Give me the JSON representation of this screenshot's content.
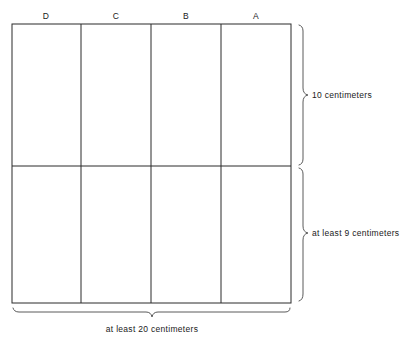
{
  "diagram": {
    "type": "engineering-dimension-diagram",
    "background_color": "#ffffff",
    "line_color": "#2b2b2b",
    "text_color": "#1a1a1a",
    "grid": {
      "left": 12,
      "right": 291,
      "top": 24,
      "bottom": 303,
      "vertical_dividers": [
        81,
        151,
        221
      ],
      "horizontal_dividers": [
        166
      ],
      "columns": 4,
      "rows": 2
    },
    "column_labels": [
      {
        "text": "D",
        "center_x": 46,
        "y": 11
      },
      {
        "text": "C",
        "center_x": 116,
        "y": 11
      },
      {
        "text": "B",
        "center_x": 186,
        "y": 11
      },
      {
        "text": "A",
        "center_x": 256,
        "y": 11
      }
    ],
    "dimensions": {
      "right_top": {
        "label": "10 centimeters",
        "brace_top": 24,
        "brace_bottom": 166,
        "label_x": 315,
        "label_y": 91
      },
      "right_bottom": {
        "label": "at least 9 centimeters",
        "brace_top": 166,
        "brace_bottom": 303,
        "label_x": 315,
        "label_y": 229
      },
      "bottom": {
        "label": "at least 20 centimeters",
        "brace_left": 12,
        "brace_right": 291,
        "label_x": 152,
        "label_y": 325
      }
    }
  }
}
